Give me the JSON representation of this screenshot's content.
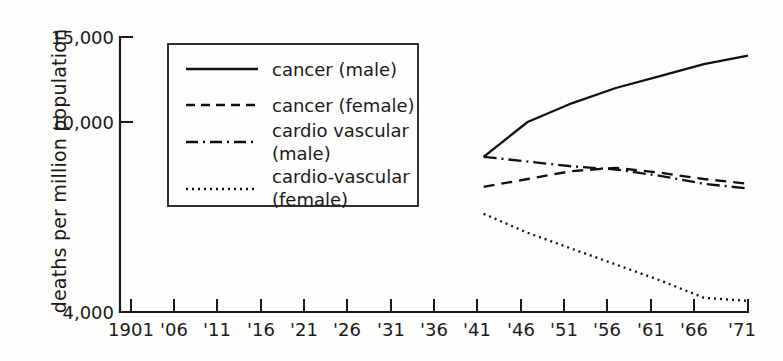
{
  "chart_data": {
    "type": "line",
    "title": "",
    "xlabel": "",
    "ylabel": "deaths per million population",
    "grid": false,
    "legend_position": "upper-left-inside",
    "x": [
      1941,
      1946,
      1951,
      1956,
      1961,
      1966,
      1971
    ],
    "xticklabels": [
      "1901",
      "'06",
      "'11",
      "'16",
      "'21",
      "'26",
      "'31",
      "'36",
      "'41",
      "'46",
      "'51",
      "'56",
      "'61",
      "'66",
      "'71"
    ],
    "xtickvalues": [
      1901,
      1906,
      1911,
      1916,
      1921,
      1926,
      1931,
      1936,
      1941,
      1946,
      1951,
      1956,
      1961,
      1966,
      1971
    ],
    "xlim": [
      1901,
      1971
    ],
    "yticklabels": [
      "4,000",
      "10,000",
      "15,000"
    ],
    "ytickvalues": [
      4000,
      10000,
      15000
    ],
    "ylim": [
      4000,
      15000
    ],
    "series": [
      {
        "name": "cancer (male)",
        "style": "solid",
        "values": [
          8900,
          10000,
          11100,
          12000,
          12700,
          13400,
          13900
        ]
      },
      {
        "name": "cancer (female)",
        "style": "dashed",
        "values": [
          7950,
          8200,
          8450,
          8550,
          8400,
          8200,
          8050
        ]
      },
      {
        "name": "cardio vascular (male)",
        "style": "dash-dot",
        "values": [
          8900,
          8750,
          8600,
          8500,
          8300,
          8050,
          7900
        ]
      },
      {
        "name": "cardio-vascular (female)",
        "style": "dotted",
        "values": [
          7100,
          6500,
          6000,
          5500,
          5000,
          4450,
          4350
        ]
      }
    ]
  },
  "legend": {
    "entries": [
      {
        "label": "cancer (male)",
        "label2": "",
        "style": "solid"
      },
      {
        "label": "cancer (female)",
        "label2": "",
        "style": "dashed"
      },
      {
        "label": "cardio vascular",
        "label2": "(male)",
        "style": "dash-dot"
      },
      {
        "label": "cardio-vascular",
        "label2": "(female)",
        "style": "dotted"
      }
    ]
  },
  "axes": {
    "y_title": "deaths per million population",
    "y_ticks": [
      {
        "label": "15,000"
      },
      {
        "label": "10,000"
      },
      {
        "label": "4,000"
      }
    ],
    "x_ticks": [
      {
        "label": "1901"
      },
      {
        "label": "'06"
      },
      {
        "label": "'11"
      },
      {
        "label": "'16"
      },
      {
        "label": "'21"
      },
      {
        "label": "'26"
      },
      {
        "label": "'31"
      },
      {
        "label": "'36"
      },
      {
        "label": "'41"
      },
      {
        "label": "'46"
      },
      {
        "label": "'51"
      },
      {
        "label": "'56"
      },
      {
        "label": "'61"
      },
      {
        "label": "'66"
      },
      {
        "label": "'71"
      }
    ]
  }
}
